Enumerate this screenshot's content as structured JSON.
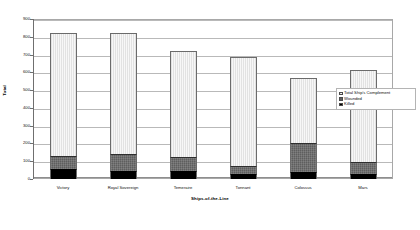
{
  "chart_data": {
    "type": "bar",
    "subtype": "stacked-column",
    "title": "",
    "xlabel": "Ships-of-the-Line",
    "ylabel": "Total",
    "ylim": [
      0,
      900
    ],
    "yticks": [
      0,
      100,
      200,
      300,
      400,
      500,
      600,
      700,
      800,
      900
    ],
    "ytick_labels": [
      "0",
      "100",
      "200",
      "300",
      "400",
      "500",
      "600",
      "700",
      "800",
      "900"
    ],
    "grid": true,
    "legend_position": "right-inside",
    "categories": [
      "Victory",
      "Royal Sovereign",
      "Temeraire",
      "Tonnant",
      "Colossus",
      "Mars"
    ],
    "series": [
      {
        "name": "Killed",
        "color": "#000000",
        "values": [
          57,
          47,
          47,
          26,
          40,
          29
        ]
      },
      {
        "name": "Wounded",
        "color": "#5e5e5e",
        "values": [
          75,
          94,
          76,
          50,
          160,
          69
        ]
      },
      {
        "name": "Total Ship's Complement",
        "color": "#f2f2f2",
        "values": [
          688,
          680,
          595,
          612,
          371,
          514
        ]
      }
    ],
    "stack_totals": [
      820,
      821,
      718,
      688,
      571,
      612
    ]
  },
  "axes": {
    "y_title": "Total",
    "x_title": "Ships-of-the-Line"
  },
  "legend": {
    "items": [
      {
        "label": "Total Ship's Complement",
        "swatch": "total-swatch"
      },
      {
        "label": "Wounded",
        "swatch": "wounded-swatch"
      },
      {
        "label": "Killed",
        "swatch": "killed-swatch"
      }
    ]
  }
}
